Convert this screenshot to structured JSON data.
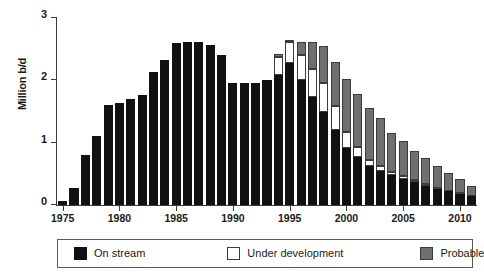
{
  "chart_data": {
    "type": "bar",
    "stacked": true,
    "title": "",
    "subtitle": "",
    "xlabel": "",
    "ylabel": "Million b/d",
    "ylim": [
      0,
      3
    ],
    "yticks": [
      0,
      1,
      2,
      3
    ],
    "ytick_labels": [
      "0",
      "1",
      "2",
      "3"
    ],
    "xlim": [
      1974.5,
      2011.5
    ],
    "xticks": [
      1975,
      1980,
      1985,
      1990,
      1995,
      2000,
      2005,
      2010
    ],
    "xtick_labels": [
      "1975",
      "1980",
      "1985",
      "1990",
      "1995",
      "2000",
      "2005",
      "2010"
    ],
    "grid": false,
    "legend_position": "bottom",
    "categories": [
      "1975",
      "1976",
      "1977",
      "1978",
      "1979",
      "1980",
      "1981",
      "1982",
      "1983",
      "1984",
      "1985",
      "1986",
      "1987",
      "1988",
      "1989",
      "1990",
      "1991",
      "1992",
      "1993",
      "1994",
      "1995",
      "1996",
      "1997",
      "1998",
      "1999",
      "2000",
      "2001",
      "2002",
      "2003",
      "2004",
      "2005",
      "2006",
      "2007",
      "2008",
      "2009",
      "2010",
      "2011"
    ],
    "series": [
      {
        "name": "On stream",
        "color": "#111111",
        "values": [
          0.06,
          0.27,
          0.81,
          1.11,
          1.6,
          1.64,
          1.7,
          1.77,
          2.14,
          2.33,
          2.6,
          2.62,
          2.62,
          2.57,
          2.4,
          1.95,
          1.95,
          1.95,
          2.01,
          2.08,
          2.28,
          2.0,
          1.73,
          1.5,
          1.2,
          0.92,
          0.77,
          0.62,
          0.55,
          0.48,
          0.42,
          0.37,
          0.31,
          0.26,
          0.22,
          0.18,
          0.14
        ]
      },
      {
        "name": "Under development",
        "color": "#ffffff",
        "values": [
          0,
          0,
          0,
          0,
          0,
          0,
          0,
          0,
          0,
          0,
          0,
          0,
          0,
          0,
          0,
          0,
          0,
          0,
          0,
          0.29,
          0.33,
          0.4,
          0.46,
          0.45,
          0.39,
          0.25,
          0.16,
          0.11,
          0.07,
          0.05,
          0.04,
          0.03,
          0.02,
          0.02,
          0.01,
          0.01,
          0.0
        ]
      },
      {
        "name": "Probable",
        "color": "#6f6f6f",
        "values": [
          0,
          0,
          0,
          0,
          0,
          0,
          0,
          0,
          0,
          0,
          0,
          0,
          0,
          0,
          0,
          0,
          0,
          0,
          0,
          0.05,
          0.04,
          0.22,
          0.43,
          0.6,
          0.71,
          0.85,
          0.85,
          0.82,
          0.77,
          0.63,
          0.56,
          0.47,
          0.42,
          0.34,
          0.28,
          0.22,
          0.17
        ]
      }
    ],
    "totals": [
      0.06,
      0.27,
      0.81,
      1.11,
      1.6,
      1.64,
      1.7,
      1.77,
      2.14,
      2.33,
      2.6,
      2.62,
      2.62,
      2.57,
      2.4,
      1.95,
      1.95,
      1.95,
      2.01,
      2.42,
      2.65,
      2.62,
      2.62,
      2.55,
      2.3,
      2.02,
      1.78,
      1.55,
      1.39,
      1.16,
      1.02,
      0.87,
      0.75,
      0.62,
      0.51,
      0.41,
      0.31
    ]
  },
  "legend": {
    "items": [
      {
        "label": "On stream",
        "swatch": "onstream"
      },
      {
        "label": "Under development",
        "swatch": "underdev"
      },
      {
        "label": "Probable",
        "swatch": "probable"
      }
    ]
  }
}
